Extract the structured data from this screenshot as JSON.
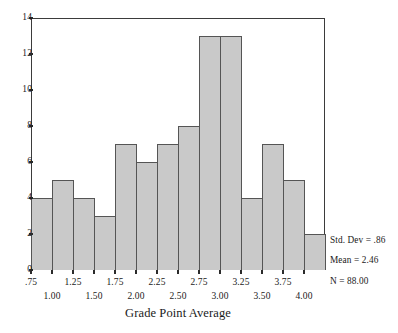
{
  "chart_data": {
    "type": "bar",
    "title": "",
    "xlabel": "Grade Point Average",
    "ylabel": "",
    "categories": [
      ".875",
      "1.125",
      "1.375",
      "1.625",
      "1.875",
      "2.125",
      "2.375",
      "2.625",
      "2.875",
      "3.125",
      "3.375",
      "3.625",
      "3.875",
      "4.125"
    ],
    "values": [
      4,
      5,
      4,
      3,
      7,
      6,
      7,
      8,
      13,
      13,
      4,
      7,
      5,
      2
    ],
    "bin_width": 0.25,
    "bin_edges": [
      0.75,
      1.0,
      1.25,
      1.5,
      1.75,
      2.0,
      2.25,
      2.5,
      2.75,
      3.0,
      3.25,
      3.5,
      3.75,
      4.0,
      4.25
    ],
    "ylim": [
      0,
      14
    ],
    "xlim": [
      0.75,
      4.25
    ],
    "ytick_values": [
      0,
      2,
      4,
      6,
      8,
      10,
      12,
      14
    ],
    "ytick_labels": [
      "0",
      "2",
      "4",
      "6",
      "8",
      "10",
      "12",
      "14"
    ],
    "xtick_values": [
      0.75,
      1.0,
      1.25,
      1.5,
      1.75,
      2.0,
      2.25,
      2.5,
      2.75,
      3.0,
      3.25,
      3.5,
      3.75,
      4.0
    ],
    "xtick_labels": [
      ".75",
      "1.00",
      "1.25",
      "1.50",
      "1.75",
      "2.00",
      "2.25",
      "2.50",
      "2.75",
      "3.00",
      "3.25",
      "3.50",
      "3.75",
      "4.00"
    ],
    "grid": false,
    "legend": "none",
    "bar_fill_color": "#c9c9c9",
    "bar_edge_color": "#555555",
    "axis_color": "#3b3b3b",
    "background_color": "#ffffff"
  },
  "annotations": {
    "std_dev": "Std. Dev = .86",
    "mean": "Mean = 2.46",
    "n": "N = 88.00"
  },
  "axis": {
    "x_title": "Grade Point Average"
  }
}
